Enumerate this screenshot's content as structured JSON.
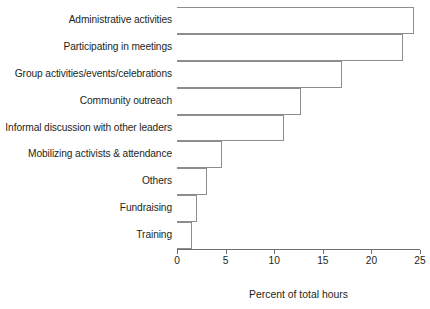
{
  "chart_data": {
    "type": "bar",
    "orientation": "horizontal",
    "title": "",
    "xlabel": "Percent of total hours",
    "ylabel": "",
    "xlim": [
      0,
      25
    ],
    "xticks": [
      0,
      5,
      10,
      15,
      20,
      25
    ],
    "grid": false,
    "legend": null,
    "categories": [
      "Administrative activities",
      "Participating in meetings",
      "Group activities/events/celebrations",
      "Community outreach",
      "Informal discussion with other leaders",
      "Mobilizing activists & attendance",
      "Others",
      "Fundraising",
      "Training"
    ],
    "values": [
      24.4,
      23.3,
      17.0,
      12.8,
      11.0,
      4.6,
      3.1,
      2.1,
      1.5
    ],
    "bar_fill": "#ffffff",
    "bar_edge": "#8d8d8d",
    "axis_color": "#6e6e6e"
  },
  "axis": {
    "title": "Percent of total hours",
    "tick_labels": [
      "0",
      "5",
      "10",
      "15",
      "20",
      "25"
    ]
  }
}
